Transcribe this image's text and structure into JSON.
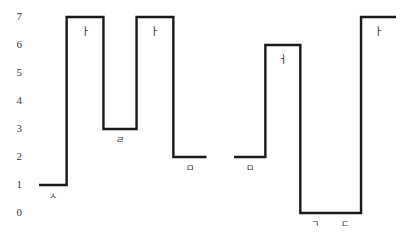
{
  "chart_data": {
    "type": "line",
    "title": "",
    "subtitle": "",
    "xlabel": "",
    "ylabel": "",
    "grid": false,
    "legend": null,
    "step_style": "post",
    "ylim": [
      0,
      7
    ],
    "xlim": [
      0,
      10
    ],
    "yticks": [
      7,
      6,
      5,
      4,
      3,
      2,
      1,
      0
    ],
    "ytick_labels": [
      "7",
      "6",
      "5",
      "4",
      "3",
      "2",
      "1",
      "0"
    ],
    "xtick_labels": [],
    "series": [
      {
        "name": "group-1",
        "segments": [
          {
            "label": "ㅅ",
            "value": 1,
            "x_start": 0.3,
            "x_end": 1.05,
            "label_pos": "below"
          },
          {
            "label": "ㅏ",
            "value": 7,
            "x_start": 1.05,
            "x_end": 2.05,
            "label_pos": "inside"
          },
          {
            "label": "ㄹ",
            "value": 3,
            "x_start": 2.05,
            "x_end": 2.95,
            "label_pos": "below"
          },
          {
            "label": "ㅏ",
            "value": 7,
            "x_start": 2.95,
            "x_end": 3.95,
            "label_pos": "inside"
          },
          {
            "label": "ㅁ",
            "value": 2,
            "x_start": 3.95,
            "x_end": 4.85,
            "label_pos": "below"
          }
        ]
      },
      {
        "name": "group-2",
        "segments": [
          {
            "label": "ㅁ",
            "value": 2,
            "x_start": 5.6,
            "x_end": 6.45,
            "label_pos": "below"
          },
          {
            "label": "ㅓ",
            "value": 6,
            "x_start": 6.45,
            "x_end": 7.4,
            "label_pos": "inside"
          },
          {
            "label": "ㄱ",
            "value": 0,
            "x_start": 7.4,
            "x_end": 8.2,
            "label_pos": "below"
          },
          {
            "label": "ㄷ",
            "value": 0,
            "x_start": 8.2,
            "x_end": 9.05,
            "label_pos": "below"
          },
          {
            "label": "ㅏ",
            "value": 7,
            "x_start": 9.05,
            "x_end": 10.0,
            "label_pos": "inside"
          }
        ]
      }
    ],
    "colors": {
      "line": "#1a1a1a",
      "tick_text": "#3a3a3a",
      "label_text": "#2b2b2b",
      "background": "#ffffff"
    },
    "line_width": 2.4
  }
}
